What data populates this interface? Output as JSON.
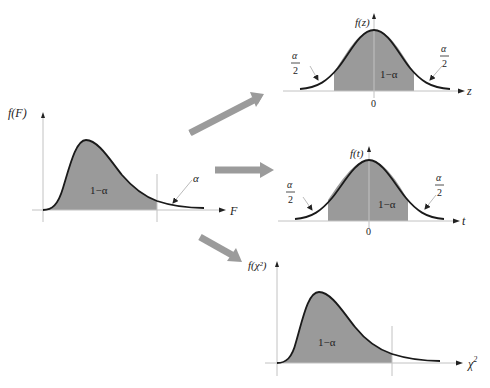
{
  "diagram": {
    "colors": {
      "shade": "#9a9a9a",
      "curve": "#1a1a1a",
      "axis": "#b8b8b8",
      "arrow": "#9b9b9b",
      "text": "#222222"
    },
    "source_plot": {
      "name": "F distribution",
      "y_label": "f(F)",
      "x_label": "F",
      "center_label": "1−α",
      "tail_label": "α"
    },
    "targets": [
      {
        "name": "Z distribution",
        "y_label": "f(z)",
        "x_label": "z",
        "zero_label": "0",
        "center_label": "1−α",
        "left_tail": {
          "numerator": "α",
          "denominator": "2"
        },
        "right_tail": {
          "numerator": "α",
          "denominator": "2"
        }
      },
      {
        "name": "t distribution",
        "y_label": "f(t)",
        "x_label": "t",
        "zero_label": "0",
        "center_label": "1−α",
        "left_tail": {
          "numerator": "α",
          "denominator": "2"
        },
        "right_tail": {
          "numerator": "α",
          "denominator": "2"
        }
      },
      {
        "name": "Chi-square distribution",
        "y_label": "f(χ²)",
        "x_label": "χ²",
        "x_label_base": "χ",
        "x_label_sup": "2",
        "center_label": "1−α"
      }
    ]
  }
}
